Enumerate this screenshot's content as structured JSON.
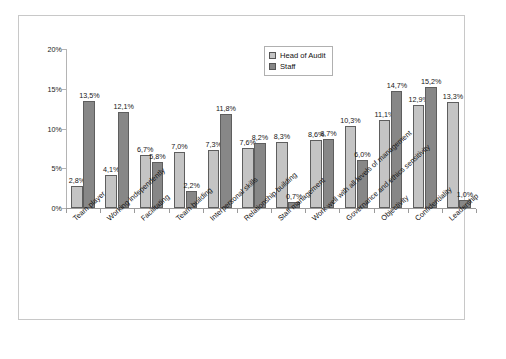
{
  "chart_data": {
    "type": "bar",
    "title": "",
    "subtitle": "",
    "xlabel": "",
    "ylabel": "",
    "ylim": [
      0,
      20
    ],
    "ytick_labels": [
      "0%",
      "5%",
      "10%",
      "15%",
      "20%"
    ],
    "ytick_values": [
      0,
      5,
      10,
      15,
      20
    ],
    "grid": false,
    "legend_position": "top-right",
    "value_label_suffix": "%",
    "decimal_separator": ",",
    "categories": [
      "Team player",
      "Working independently",
      "Facilitating",
      "Team building",
      "Interpersonal skills",
      "Relationship building",
      "Staff management",
      "Work well with all levels of management",
      "Governance and ethics sensitivity",
      "Objectivity",
      "Confidentiality",
      "Leadership"
    ],
    "series": [
      {
        "name": "Head of Audit",
        "color": "#c4c4c4",
        "values": [
          2.8,
          4.1,
          6.7,
          7.0,
          7.3,
          7.6,
          8.3,
          8.6,
          10.3,
          11.1,
          12.9,
          13.3
        ],
        "labels": [
          "2,8%",
          "4,1%",
          "6,7%",
          "7,0%",
          "7,3%",
          "7,6%",
          "8,3%",
          "8,6%",
          "10,3%",
          "11,1%",
          "12,9%",
          "13,3%"
        ]
      },
      {
        "name": "Staff",
        "color": "#878787",
        "values": [
          13.5,
          12.1,
          5.8,
          2.2,
          11.8,
          8.2,
          0.7,
          8.7,
          6.0,
          14.7,
          15.2,
          1.0
        ],
        "labels": [
          "13,5%",
          "12,1%",
          "5,8%",
          "2,2%",
          "11,8%",
          "8,2%",
          "0,7%",
          "8,7%",
          "6,0%",
          "14,7%",
          "15,2%",
          "1,0%"
        ]
      }
    ]
  },
  "legend": {
    "items": [
      {
        "label": "Head of Audit",
        "swatch": "light"
      },
      {
        "label": "Staff",
        "swatch": "dark"
      }
    ]
  }
}
